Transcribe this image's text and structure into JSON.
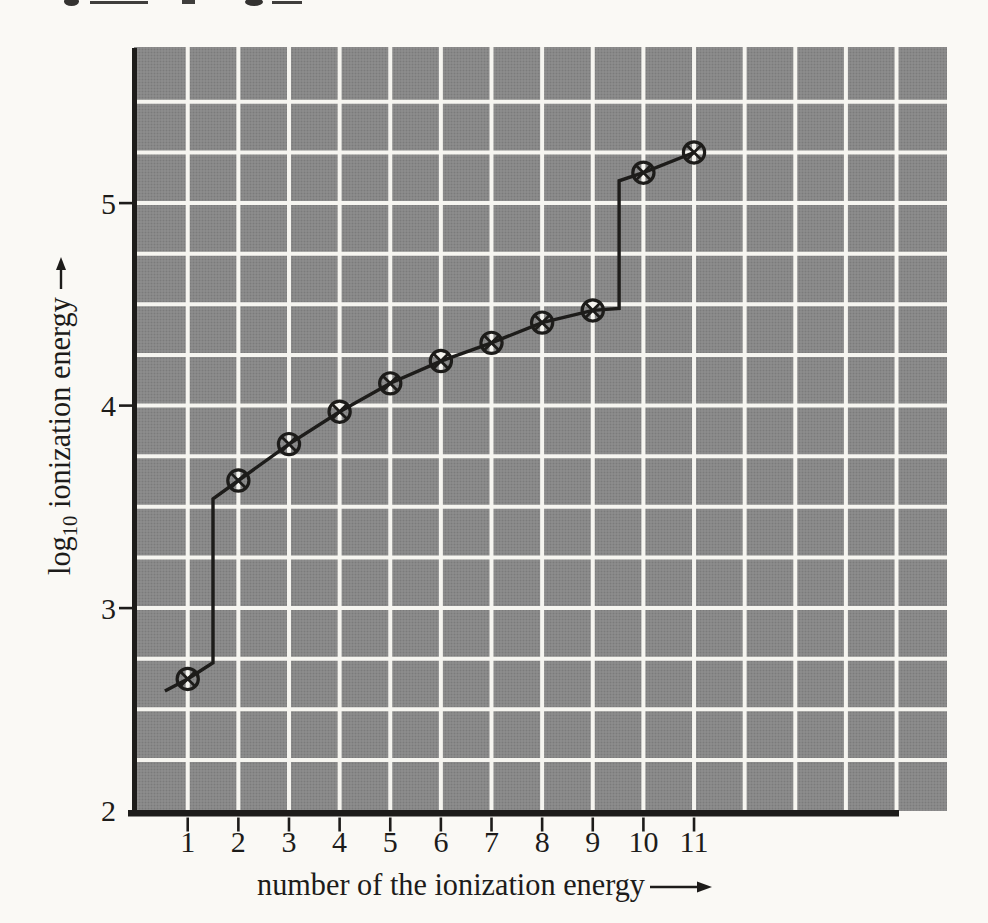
{
  "figure": {
    "y_axis": {
      "label_pre": "log",
      "label_sub": "10",
      "label_post": " ionization energy",
      "tick_labels": [
        "2",
        "3",
        "4",
        "5"
      ],
      "tick_values": [
        2,
        3,
        4,
        5
      ],
      "ticks_with_mark": [
        3,
        4,
        5
      ]
    },
    "x_axis": {
      "label": "number of the ionization energy",
      "tick_labels": [
        "1",
        "2",
        "3",
        "4",
        "5",
        "6",
        "7",
        "8",
        "9",
        "10",
        "11"
      ],
      "tick_values": [
        1,
        2,
        3,
        4,
        5,
        6,
        7,
        8,
        9,
        10,
        11
      ]
    }
  },
  "chart_data": {
    "type": "line",
    "title": "",
    "xlabel": "number of the ionization energy",
    "ylabel": "log10 ionization energy",
    "x": [
      1,
      2,
      3,
      4,
      5,
      6,
      7,
      8,
      9,
      10,
      11
    ],
    "values": [
      2.65,
      3.63,
      3.81,
      3.97,
      4.11,
      4.22,
      4.31,
      4.41,
      4.47,
      5.15,
      5.25
    ],
    "line_path": [
      [
        0.55,
        2.59
      ],
      [
        1,
        2.65
      ],
      [
        1.5,
        2.73
      ],
      [
        1.5,
        3.54
      ],
      [
        2,
        3.63
      ],
      [
        3,
        3.81
      ],
      [
        4,
        3.97
      ],
      [
        5,
        4.11
      ],
      [
        6,
        4.22
      ],
      [
        7,
        4.31
      ],
      [
        8,
        4.41
      ],
      [
        9,
        4.47
      ],
      [
        9.52,
        4.48
      ],
      [
        9.52,
        5.11
      ],
      [
        10,
        5.15
      ],
      [
        11,
        5.25
      ]
    ],
    "xlim": [
      0,
      16
    ],
    "ylim": [
      2,
      5.75
    ],
    "grid": true,
    "legend": false,
    "marker": "circled-x"
  },
  "colors": {
    "paper": "#faf9f5",
    "grid_fill": "#8e8e8e",
    "grid_dot": "#7b7b7b",
    "gridline": "#f6f5f0",
    "ink": "#1d1c1a"
  }
}
